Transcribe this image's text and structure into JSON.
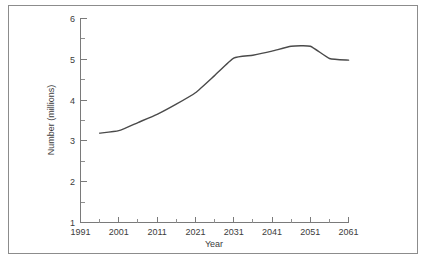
{
  "chart_data": {
    "type": "line",
    "title": "",
    "subtitle": "",
    "xlabel": "Year",
    "ylabel": "Number (millions)",
    "xlim": [
      1991,
      2061
    ],
    "ylim": [
      1,
      6
    ],
    "grid": false,
    "legend": null,
    "x_ticks": [
      1991,
      2001,
      2011,
      2021,
      2031,
      2041,
      2051,
      2061
    ],
    "x_tick_labels": [
      "1991",
      "2001",
      "2011",
      "2021",
      "2031",
      "2041",
      "2051",
      "2061"
    ],
    "x_minor_ticks": [
      1996,
      2006,
      2016,
      2026,
      2036,
      2046,
      2056
    ],
    "y_ticks": [
      1,
      2,
      3,
      4,
      5,
      6
    ],
    "y_tick_labels": [
      "1",
      "2",
      "3",
      "4",
      "5",
      "6"
    ],
    "y_minor_ticks": [
      1.5,
      2.5,
      3.5,
      4.5,
      5.5
    ],
    "series": [
      {
        "name": "Number (millions)",
        "color": "#4a4a4a",
        "x": [
          1996,
          2001,
          2006,
          2011,
          2016,
          2021,
          2026,
          2031,
          2036,
          2041,
          2046,
          2051,
          2056,
          2061
        ],
        "values": [
          3.19,
          3.25,
          3.45,
          3.65,
          3.9,
          4.18,
          4.6,
          5.03,
          5.1,
          5.2,
          5.32,
          5.32,
          5.02,
          4.98
        ]
      }
    ]
  },
  "axes": {
    "x_title": "Year",
    "y_title": "Number (millions)"
  }
}
